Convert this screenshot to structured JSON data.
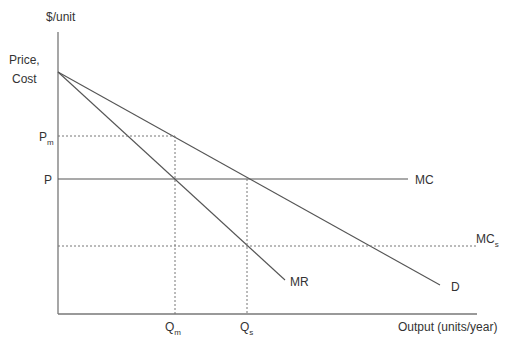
{
  "diagram": {
    "y_axis_label": "$/unit",
    "y_axis_title_line1": "Price,",
    "y_axis_title_line2": "Cost",
    "x_axis_label": "Output (units/year)",
    "price_labels": {
      "pm_main": "P",
      "pm_sub": "m",
      "p": "P"
    },
    "quantity_labels": {
      "qm_main": "Q",
      "qm_sub": "m",
      "qs_main": "Q",
      "qs_sub": "s"
    },
    "curves": {
      "mc": "MC",
      "mcs_main": "MC",
      "mcs_sub": "s",
      "mr": "MR",
      "d": "D"
    },
    "colors": {
      "axis": "#777777",
      "line": "#555555",
      "dashed": "#777777",
      "text": "#333333"
    }
  }
}
